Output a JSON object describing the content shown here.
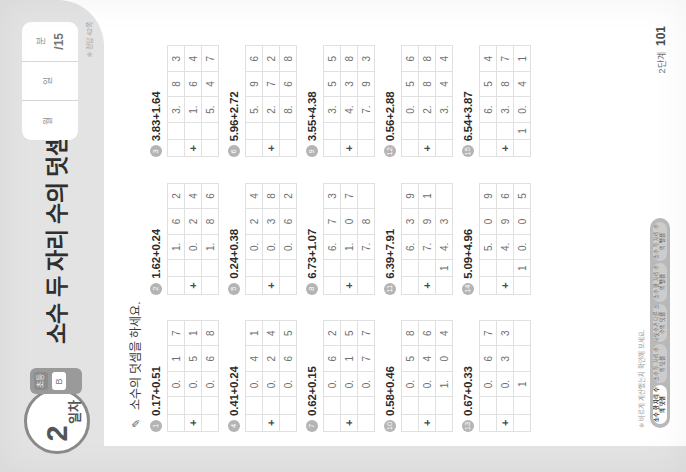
{
  "header": {
    "day_number": "2",
    "day_unit": "일차",
    "chip_top": "초등",
    "chip_bottom": "B",
    "title": "소수 두 자리 수의 덧셈",
    "score_card": {
      "month_label": "월",
      "month_value": "",
      "day_label": "일",
      "day_value": "",
      "correct_label": "분",
      "correct_value": "초",
      "total": "/15"
    },
    "score_note": "※ 정답 42쪽"
  },
  "instruction": {
    "icon": "pencil-icon",
    "text": "소수의 덧셈을 하세요."
  },
  "problems": [
    {
      "no": "1",
      "expression": "0.17+0.51",
      "addend1": [
        "0.",
        "1",
        "7"
      ],
      "addend2": [
        "0.",
        "5",
        "1"
      ],
      "sum": [
        "0.",
        "6",
        "8"
      ]
    },
    {
      "no": "2",
      "expression": "1.62+0.24",
      "addend1": [
        "1.",
        "6",
        "2"
      ],
      "addend2": [
        "0.",
        "2",
        "4"
      ],
      "sum": [
        "1.",
        "8",
        "6"
      ]
    },
    {
      "no": "3",
      "expression": "3.83+1.64",
      "addend1": [
        "3.",
        "8",
        "3"
      ],
      "addend2": [
        "1.",
        "6",
        "4"
      ],
      "sum": [
        "5.",
        "4",
        "7"
      ]
    },
    {
      "no": "4",
      "expression": "0.41+0.24",
      "addend1": [
        "0.",
        "4",
        "1"
      ],
      "addend2": [
        "0.",
        "2",
        "4"
      ],
      "sum": [
        "0.",
        "6",
        "5"
      ]
    },
    {
      "no": "5",
      "expression": "0.24+0.38",
      "addend1": [
        "0.",
        "2",
        "4"
      ],
      "addend2": [
        "0.",
        "3",
        "8"
      ],
      "sum": [
        "0.",
        "6",
        "2"
      ]
    },
    {
      "no": "6",
      "expression": "5.96+2.72",
      "addend1": [
        "5.",
        "9",
        "6"
      ],
      "addend2": [
        "2.",
        "7",
        "2"
      ],
      "sum": [
        "8.",
        "6",
        "8"
      ]
    },
    {
      "no": "7",
      "expression": "0.62+0.15",
      "addend1": [
        "0.",
        "6",
        "2"
      ],
      "addend2": [
        "0.",
        "1",
        "5"
      ],
      "sum": [
        "0.",
        "7",
        "7"
      ]
    },
    {
      "no": "8",
      "expression": "6.73+1.07",
      "addend1": [
        "6.",
        "7",
        "3"
      ],
      "addend2": [
        "1.",
        "0",
        "7"
      ],
      "sum": [
        "7.",
        "8",
        ""
      ]
    },
    {
      "no": "9",
      "expression": "3.55+4.38",
      "addend1": [
        "3.",
        "5",
        "5"
      ],
      "addend2": [
        "4.",
        "3",
        "8"
      ],
      "sum": [
        "7.",
        "9",
        "3"
      ]
    },
    {
      "no": "10",
      "expression": "0.58+0.46",
      "addend1": [
        "0.",
        "5",
        "8"
      ],
      "addend2": [
        "0.",
        "4",
        "6"
      ],
      "sum": [
        "1.",
        "0",
        "4"
      ]
    },
    {
      "no": "11",
      "expression": "6.39+7.91",
      "addend1": [
        "6.",
        "3",
        "9"
      ],
      "addend2": [
        "7.",
        "9",
        "1"
      ],
      "sum": [
        "14.",
        "3",
        ""
      ],
      "sum_lead": "1",
      "sum_cells": [
        "4.",
        "3",
        ""
      ]
    },
    {
      "no": "12",
      "expression": "0.56+2.88",
      "addend1": [
        "0.",
        "5",
        "6"
      ],
      "addend2": [
        "2.",
        "8",
        "8"
      ],
      "sum": [
        "3.",
        "4",
        "4"
      ]
    },
    {
      "no": "13",
      "expression": "0.67+0.33",
      "addend1": [
        "0.",
        "6",
        "7"
      ],
      "addend2": [
        "0.",
        "3",
        "3"
      ],
      "sum": [
        "1",
        "",
        ""
      ]
    },
    {
      "no": "14",
      "expression": "5.09+4.96",
      "addend1": [
        "5.",
        "0",
        "9"
      ],
      "addend2": [
        "4.",
        "9",
        "6"
      ],
      "sum": [
        "0.",
        "0",
        "5"
      ],
      "sum_lead": "1"
    },
    {
      "no": "15",
      "expression": "6.54+3.87",
      "addend1": [
        "6.",
        "5",
        "4"
      ],
      "addend2": [
        "3.",
        "8",
        "7"
      ],
      "sum": [
        "0.",
        "4",
        "1"
      ],
      "sum_lead": "1"
    }
  ],
  "footer": {
    "note": "※ 바르게 계산했는지 확인해 보세요.",
    "progress": [
      {
        "label": "소수 한 자리\n수의 덧셈",
        "active": true
      },
      {
        "label": "소수 두 자리\n수의 덧셈",
        "active": false
      },
      {
        "label": "자릿수가 다른\n소수의 덧셈",
        "active": false
      },
      {
        "label": "소수 한 자리\n수의 뺄셈",
        "active": false
      },
      {
        "label": "소수 두 자리\n수의 뺄셈",
        "active": false
      }
    ],
    "page_label": "2단계",
    "page_number": "101"
  },
  "colors": {
    "band": "#e3e3e3",
    "ink": "#2b2b2b",
    "grid_line": "#e0e0e0",
    "digit": "#6e6e6e"
  }
}
